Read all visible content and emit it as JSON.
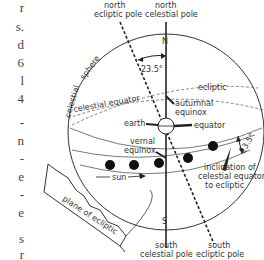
{
  "labels": {
    "north_ecliptic_pole": [
      "north",
      "ecliptic pole"
    ],
    "north_celestial_pole": [
      "north",
      "celestial pole"
    ],
    "south_celestial_pole": [
      "south",
      "celestial pole"
    ],
    "south_ecliptic_pole": [
      "south",
      "ecliptic pole"
    ],
    "n_marker": "N",
    "s_marker": "S",
    "angle_top": "23.5°",
    "angle_right": "23.5°",
    "celestial_sphere": [
      "celestial",
      "sphere"
    ],
    "celestial_equator": "celestial equator",
    "ecliptic": "ecliptic",
    "autumnal_equinox": [
      "autumnal",
      "equinox"
    ],
    "earth": "earth",
    "equator": "equator",
    "vernal_equinox": [
      "vernal",
      "equinox"
    ],
    "sun": "sun",
    "inclination": [
      "inclination of",
      "celestial equator",
      "to ecliptic"
    ],
    "plane_of_ecliptic": "plane of ecliptic"
  },
  "edge_text": {
    "chars": [
      "r",
      "s.",
      "d",
      "6",
      "l",
      "4",
      "-",
      "n",
      "-",
      "e",
      "-",
      "e",
      "s",
      "r"
    ],
    "tops": [
      6,
      26,
      44,
      62,
      80,
      98,
      122,
      140,
      158,
      178,
      196,
      214,
      240,
      256
    ]
  },
  "colors": {
    "ink": "#222222",
    "background": "#ffffff"
  }
}
